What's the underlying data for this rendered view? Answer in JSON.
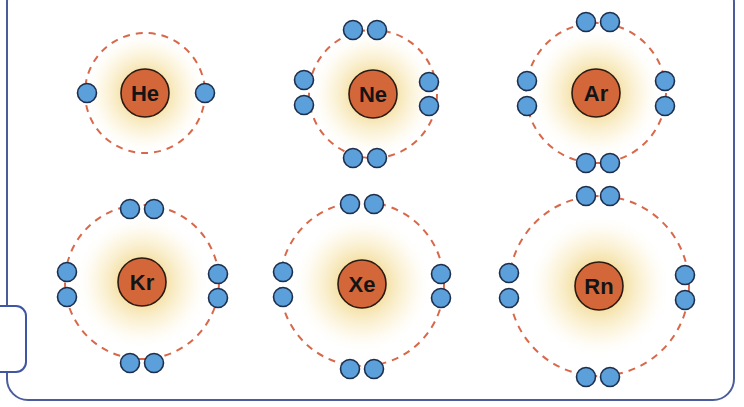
{
  "diagram": {
    "colors": {
      "frame": "#4a5d9a",
      "tab": "#3e56a3",
      "nucleus_fill": "#d4673a",
      "nucleus_stroke": "#2a1a12",
      "electron_fill": "#5b9fdb",
      "electron_stroke": "#1d2f4d",
      "orbit": "#d9684a",
      "glow_inner": "#f0d48a",
      "glow_outer": "#ffffff"
    },
    "atoms": [
      {
        "symbol": "He",
        "cx": 145,
        "cy": 93,
        "orbit_r": 60,
        "nucleus_r": 24,
        "glow_r": 62,
        "valence_electrons": 2,
        "electrons": [
          [
            87,
            93
          ],
          [
            205,
            93
          ]
        ]
      },
      {
        "symbol": "Ne",
        "cx": 373,
        "cy": 94,
        "orbit_r": 64,
        "nucleus_r": 24,
        "glow_r": 64,
        "valence_electrons": 8,
        "electrons": [
          [
            353,
            30
          ],
          [
            377,
            30
          ],
          [
            304,
            80
          ],
          [
            304,
            105
          ],
          [
            429,
            82
          ],
          [
            429,
            106
          ],
          [
            353,
            158
          ],
          [
            377,
            158
          ]
        ]
      },
      {
        "symbol": "Ar",
        "cx": 596,
        "cy": 93,
        "orbit_r": 70,
        "nucleus_r": 24,
        "glow_r": 66,
        "valence_electrons": 8,
        "electrons": [
          [
            586,
            22
          ],
          [
            610,
            22
          ],
          [
            527,
            81
          ],
          [
            527,
            106
          ],
          [
            665,
            81
          ],
          [
            665,
            106
          ],
          [
            586,
            163
          ],
          [
            610,
            163
          ]
        ]
      },
      {
        "symbol": "Kr",
        "cx": 142,
        "cy": 282,
        "orbit_r": 77,
        "nucleus_r": 24,
        "glow_r": 68,
        "valence_electrons": 8,
        "electrons": [
          [
            130,
            209
          ],
          [
            154,
            209
          ],
          [
            67,
            272
          ],
          [
            67,
            297
          ],
          [
            218,
            274
          ],
          [
            218,
            298
          ],
          [
            130,
            363
          ],
          [
            154,
            363
          ]
        ]
      },
      {
        "symbol": "Xe",
        "cx": 362,
        "cy": 284,
        "orbit_r": 82,
        "nucleus_r": 24,
        "glow_r": 70,
        "valence_electrons": 8,
        "electrons": [
          [
            350,
            204
          ],
          [
            374,
            204
          ],
          [
            283,
            272
          ],
          [
            283,
            297
          ],
          [
            441,
            274
          ],
          [
            441,
            298
          ],
          [
            350,
            369
          ],
          [
            374,
            369
          ]
        ]
      },
      {
        "symbol": "Rn",
        "cx": 599,
        "cy": 286,
        "orbit_r": 90,
        "nucleus_r": 24,
        "glow_r": 72,
        "valence_electrons": 8,
        "electrons": [
          [
            586,
            196
          ],
          [
            610,
            196
          ],
          [
            509,
            273
          ],
          [
            509,
            298
          ],
          [
            685,
            275
          ],
          [
            685,
            300
          ],
          [
            586,
            377
          ],
          [
            610,
            377
          ]
        ]
      }
    ]
  }
}
